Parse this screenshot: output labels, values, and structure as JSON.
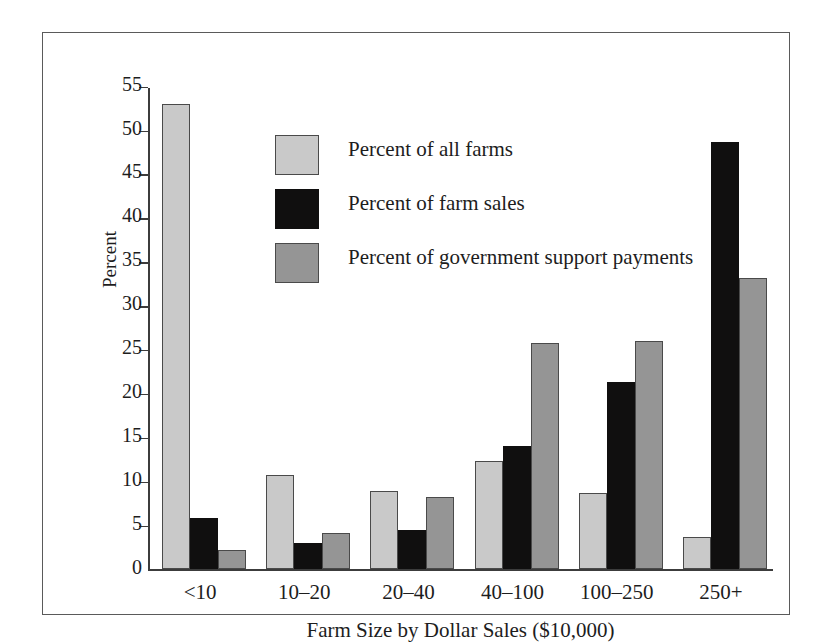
{
  "chart_data": {
    "type": "bar",
    "title": "",
    "xlabel": "Farm Size by Dollar Sales ($10,000)",
    "ylabel": "Percent",
    "categories": [
      "<10",
      "10–20",
      "20–40",
      "40–100",
      "100–250",
      "250+"
    ],
    "ylim": [
      0,
      55
    ],
    "ytick_step": 5,
    "yticks": [
      0,
      5,
      10,
      15,
      20,
      25,
      30,
      35,
      40,
      45,
      50,
      55
    ],
    "ytick_labels": [
      "0",
      "5",
      "10",
      "15",
      "20",
      "25",
      "30",
      "35",
      "40",
      "45",
      "50",
      "55"
    ],
    "grid": false,
    "legend_position": "inside-upper-center",
    "series": [
      {
        "name": "Percent of all farms",
        "color": "#c9c9c9",
        "values": [
          53.0,
          10.8,
          8.9,
          12.4,
          8.7,
          3.7
        ]
      },
      {
        "name": "Percent of farm sales",
        "color": "#100f0f",
        "values": [
          5.9,
          3.0,
          4.5,
          14.1,
          21.3,
          48.7
        ]
      },
      {
        "name": "Percent of government support payments",
        "color": "#959595",
        "values": [
          2.2,
          4.2,
          8.3,
          25.8,
          26.0,
          33.2
        ]
      }
    ]
  },
  "figure": {
    "border_color": "#5a5a5a",
    "background": "#ffffff",
    "axis_color": "#3c3c3c"
  }
}
